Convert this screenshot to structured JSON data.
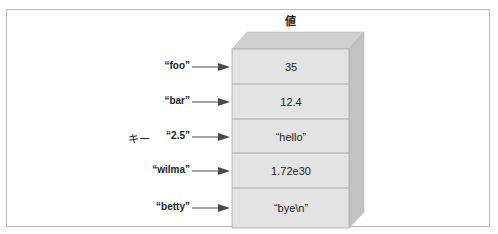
{
  "title": "値",
  "side_label": "キー",
  "colors": {
    "face": "#e3e3e3",
    "top": "#cfcfcf",
    "side": "#c2c2c2",
    "arrow": "#4a4a4a",
    "line": "#9a9a9a"
  },
  "entries": [
    {
      "key": "“foo”",
      "value": "35"
    },
    {
      "key": "“bar”",
      "value": "12.4"
    },
    {
      "key": "“2.5”",
      "value": "“hello”"
    },
    {
      "key": "“wilma”",
      "value": "1.72e30"
    },
    {
      "key": "“betty”",
      "value": "“bye\\n”"
    }
  ]
}
